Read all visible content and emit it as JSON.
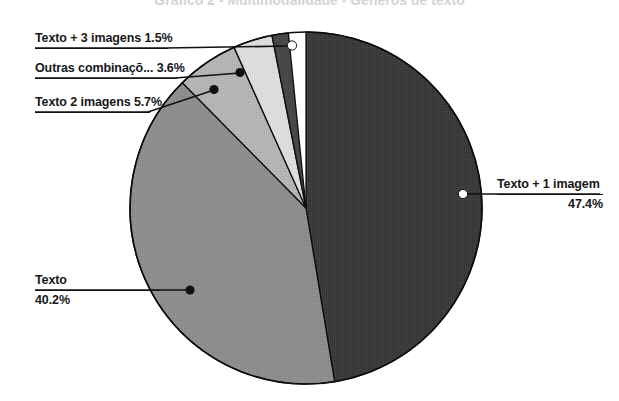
{
  "title": {
    "text": "Gráfico 2 - Multimodalidade - Géneros de texto",
    "visible_state": "cropped-at-top"
  },
  "chart_data": {
    "type": "pie",
    "title": "Gráfico 2 - Multimodalidade - Géneros de texto",
    "xlabel": "",
    "ylabel": "",
    "legend_position": "none",
    "grid": false,
    "labels_show_percent": true,
    "categories": [
      "Texto + 1 imagem",
      "Texto",
      "Texto 2 imagens",
      "Outras combinaçõ...",
      "Texto + 3 imagens"
    ],
    "values": [
      47.4,
      40.2,
      5.7,
      3.6,
      1.5
    ],
    "units": "%",
    "slices": [
      {
        "label": "Texto + 1 imagem",
        "value": 47.4,
        "display": "47.4%",
        "color": "#3b3b3b",
        "start_deg": 0.0,
        "end_deg": 170.64
      },
      {
        "label": "Texto",
        "value": 40.2,
        "display": "40.2%",
        "color": "#8d8d8d",
        "start_deg": 170.64,
        "end_deg": 315.36
      },
      {
        "label": "Texto 2 imagens",
        "value": 5.7,
        "display": "5.7%",
        "color": "#b4b4b4",
        "start_deg": 315.36,
        "end_deg": 335.88
      },
      {
        "label": "Outras combinaçõ...",
        "value": 3.6,
        "display": "3.6%",
        "color": "#dcdcdc",
        "start_deg": 335.88,
        "end_deg": 348.84
      },
      {
        "label": "Texto + 3 imagens",
        "value": 1.5,
        "display": "1.5%",
        "color": "#4a4a4a",
        "start_deg": 348.84,
        "end_deg": 354.24
      }
    ]
  },
  "labels": {
    "texto_3_imagens": {
      "text": "Texto + 3 imagens 1.5%"
    },
    "outras": {
      "text": "Outras combinaçõ... 3.6%"
    },
    "texto_2_imagens": {
      "text": "Texto 2 imagens 5.7%"
    },
    "texto": {
      "name": "Texto",
      "pct": "40.2%"
    },
    "texto_1_imagem": {
      "name": "Texto + 1 imagem",
      "pct": "47.4%"
    }
  },
  "colors": {
    "slice_texto_1_imagem": "#3b3b3b",
    "slice_texto": "#8d8d8d",
    "slice_texto_2_imagens": "#b4b4b4",
    "slice_outras": "#dcdcdc",
    "slice_texto_3_imagens": "#4a4a4a",
    "outline": "#0d0d0d",
    "leader": "#111111",
    "background": "#ffffff"
  }
}
